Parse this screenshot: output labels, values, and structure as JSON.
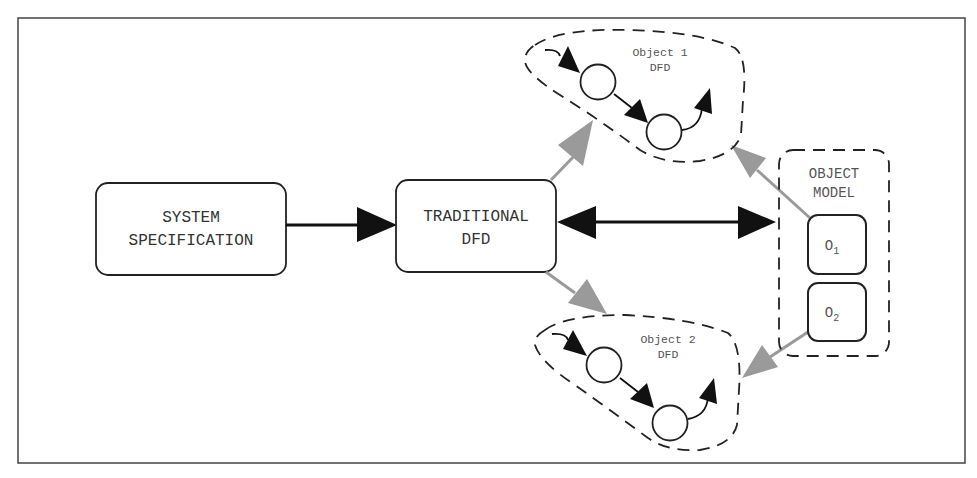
{
  "diagram": {
    "type": "flow",
    "colors": {
      "stroke": "#222222",
      "gray_arrow": "#9a9a9a",
      "background": "#ffffff",
      "text": "#333333"
    },
    "nodes": {
      "system_spec": {
        "line1": "SYSTEM",
        "line2": "SPECIFICATION"
      },
      "traditional_dfd": {
        "line1": "TRADITIONAL",
        "line2": "DFD"
      },
      "object1_dfd": {
        "line1": "Object 1",
        "line2": "DFD"
      },
      "object2_dfd": {
        "line1": "Object 2",
        "line2": "DFD"
      },
      "object_model": {
        "line1": "OBJECT",
        "line2": "MODEL",
        "items": [
          {
            "base": "O",
            "sub": "1"
          },
          {
            "base": "O",
            "sub": "2"
          }
        ]
      }
    },
    "edges": [
      {
        "from": "SYSTEM SPECIFICATION",
        "to": "TRADITIONAL DFD",
        "style": "black",
        "direction": "forward"
      },
      {
        "from": "TRADITIONAL DFD",
        "to": "OBJECT MODEL",
        "style": "black",
        "direction": "both"
      },
      {
        "from": "TRADITIONAL DFD",
        "to": "Object 1 DFD",
        "style": "gray",
        "direction": "forward"
      },
      {
        "from": "TRADITIONAL DFD",
        "to": "Object 2 DFD",
        "style": "gray",
        "direction": "forward"
      },
      {
        "from": "O1",
        "to": "Object 1 DFD",
        "style": "gray",
        "direction": "forward"
      },
      {
        "from": "O2",
        "to": "Object 2 DFD",
        "style": "gray",
        "direction": "forward"
      }
    ]
  }
}
